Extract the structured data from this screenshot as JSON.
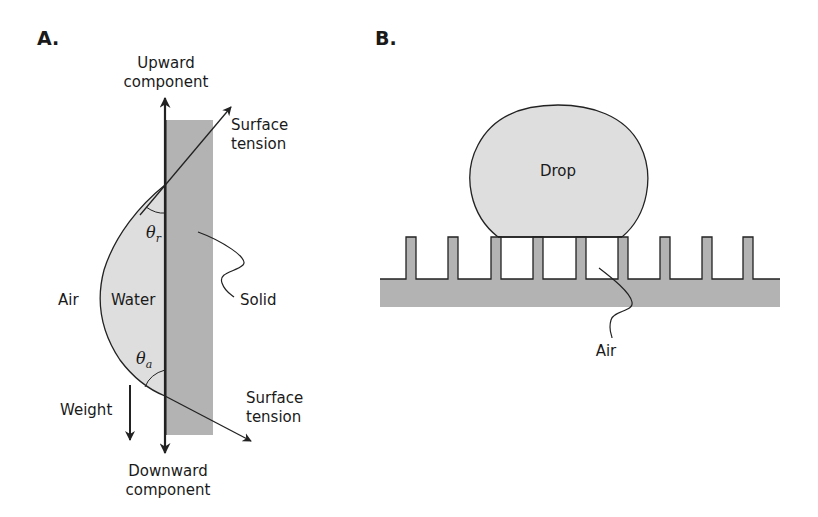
{
  "figure": {
    "colors": {
      "solid_fill": "#b3b3b3",
      "water_fill": "#dedede",
      "line": "#222222",
      "background": "#ffffff"
    },
    "panel_a": {
      "label": "A.",
      "upward_label_line1": "Upward",
      "upward_label_line2": "component",
      "surface_tension_top_line1": "Surface",
      "surface_tension_top_line2": "tension",
      "theta_r_symbol": "θ",
      "theta_r_sub": "r",
      "solid_label": "Solid",
      "air_label": "Air",
      "water_label": "Water",
      "theta_a_symbol": "θ",
      "theta_a_sub": "a",
      "weight_label": "Weight",
      "surface_tension_bottom_line1": "Surface",
      "surface_tension_bottom_line2": "tension",
      "downward_label_line1": "Downward",
      "downward_label_line2": "component"
    },
    "panel_b": {
      "label": "B.",
      "drop_label": "Drop",
      "air_label": "Air",
      "pillar_count": 9
    }
  }
}
